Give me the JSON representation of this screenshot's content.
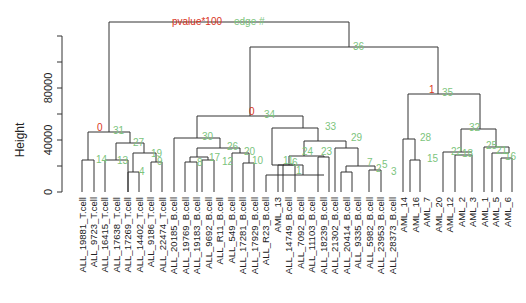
{
  "chart_data": {
    "type": "dendrogram",
    "title": "",
    "xlabel": "",
    "ylabel": "Height",
    "y_ticks": [
      0,
      20000,
      40000,
      60000,
      80000,
      100000,
      120000
    ],
    "y_tick_labels": [
      {
        "value": 0,
        "label": "0"
      },
      {
        "value": 40000,
        "label": "40000"
      },
      {
        "value": 80000,
        "label": "80000"
      }
    ],
    "ylim": [
      0,
      130000
    ],
    "legend_annotations": {
      "au_label": "pvalue*100",
      "bp_label": "edge #",
      "au_color": "#d9341c",
      "bp_color": "#7cc47c"
    },
    "leaves": [
      "ALL_19881_T.cell",
      "ALL_9723_T.cell",
      "ALL_16415_T.cell",
      "ALL_17638_T.cell",
      "ALL_17269_T.cell",
      "ALL_14402_T.cell",
      "ALL_9186_T.cell",
      "ALL_22474_T.cell",
      "ALL_20185_B.cell",
      "ALL_19769_B.cell",
      "ALL_19183_B.cell",
      "ALL_9692_B.cell",
      "ALL_R11_B.cell",
      "ALL_549_B.cell",
      "ALL_17281_B.cell",
      "ALL_17929_B.cell",
      "ALL_R23_B.cell",
      "AML_13",
      "ALL_14749_B.cell",
      "ALL_7092_B.cell",
      "ALL_11103_B.cell",
      "ALL_18239_B.cell",
      "ALL_21302_B.cell",
      "ALL_20414_B.cell",
      "ALL_9335_B.cell",
      "ALL_5982_B.cell",
      "ALL_23953_B.cell",
      "ALL_28373_B.cell",
      "AML_14",
      "AML_16",
      "AML_7",
      "AML_20",
      "AML_12",
      "AML_2",
      "AML_3",
      "AML_1",
      "AML_5",
      "AML_6"
    ],
    "node_annotations": [
      {
        "au": "",
        "edge": "37",
        "height": 131000
      },
      {
        "au": "",
        "edge": "36",
        "height": 112000
      },
      {
        "au": "1",
        "edge": "35",
        "height": 75500
      },
      {
        "au": "0",
        "edge": "34",
        "height": 59000
      },
      {
        "au": "0",
        "edge": "31",
        "height": 45500
      },
      {
        "au": "",
        "edge": "33",
        "height": 49000
      },
      {
        "au": "",
        "edge": "32",
        "height": 47500
      },
      {
        "au": "",
        "edge": "30",
        "height": 42000
      },
      {
        "au": "",
        "edge": "29",
        "height": 40500
      },
      {
        "au": "",
        "edge": "28",
        "height": 40000
      },
      {
        "au": "",
        "edge": "27",
        "height": 36500
      },
      {
        "au": "",
        "edge": "26",
        "height": 34500
      },
      {
        "au": "",
        "edge": "25",
        "height": 32500
      },
      {
        "au": "",
        "edge": "24",
        "height": 31000
      },
      {
        "au": "",
        "edge": "23",
        "height": 30500
      },
      {
        "au": "",
        "edge": "22",
        "height": 30500
      },
      {
        "au": "",
        "edge": "21",
        "height": 30000
      },
      {
        "au": "",
        "edge": "20",
        "height": 29500
      },
      {
        "au": "",
        "edge": "19",
        "height": 29500
      },
      {
        "au": "",
        "edge": "18",
        "height": 28000
      },
      {
        "au": "",
        "edge": "17",
        "height": 26500
      },
      {
        "au": "",
        "edge": "16",
        "height": 26500
      },
      {
        "au": "",
        "edge": "15",
        "height": 24500
      },
      {
        "au": "",
        "edge": "14",
        "height": 26500
      },
      {
        "au": "",
        "edge": "13",
        "height": 26500
      },
      {
        "au": "",
        "edge": "12",
        "height": 24500
      },
      {
        "au": "",
        "edge": "11",
        "height": 22500
      },
      {
        "au": "",
        "edge": "10",
        "height": 22000
      },
      {
        "au": "",
        "edge": "9",
        "height": 23500
      },
      {
        "au": "",
        "edge": "8",
        "height": 23500
      },
      {
        "au": "",
        "edge": "7",
        "height": 18500
      },
      {
        "au": "",
        "edge": "6",
        "height": 18500
      },
      {
        "au": "",
        "edge": "5",
        "height": 16500
      },
      {
        "au": "",
        "edge": "4",
        "height": 15500
      },
      {
        "au": "",
        "edge": "3",
        "height": 15000
      },
      {
        "au": "",
        "edge": "2",
        "height": 14500
      },
      {
        "au": "",
        "edge": "1",
        "height": 14000
      }
    ]
  },
  "render": {
    "plot": {
      "x0": 82,
      "dx": 11.49,
      "y_zero": 192,
      "px_per_unit": 0.0013
    },
    "axis": {
      "x": 62,
      "y_top": 22,
      "y_bottom": 192
    },
    "ticks_px": [
      192,
      166,
      140,
      114,
      88,
      62,
      36
    ],
    "tick_labels": [
      {
        "y": 192,
        "text": "0"
      },
      {
        "y": 140,
        "text": "40000"
      },
      {
        "y": 88,
        "text": "80000"
      }
    ],
    "ylabel": {
      "x": 42,
      "y": 140,
      "text": "Height"
    },
    "header": {
      "au": {
        "x": 172,
        "y": 25,
        "text": "pvalue*100"
      },
      "bp": {
        "x": 234,
        "y": 25,
        "text": "edge #"
      }
    },
    "segments": [
      [
        109,
        22,
        349,
        22
      ],
      [
        109,
        22,
        109,
        132
      ],
      [
        349,
        22,
        349,
        47
      ],
      [
        250,
        47,
        438,
        47
      ],
      [
        250,
        47,
        250,
        116
      ],
      [
        438,
        47,
        438,
        94
      ],
      [
        88,
        132,
        130,
        132
      ],
      [
        88,
        132,
        88,
        160
      ],
      [
        130,
        132,
        130,
        143
      ],
      [
        82,
        160,
        94,
        160
      ],
      [
        82,
        160,
        82,
        192
      ],
      [
        94,
        160,
        94,
        192
      ],
      [
        116,
        143,
        144,
        143
      ],
      [
        116,
        143,
        116,
        160
      ],
      [
        144,
        143,
        144,
        153
      ],
      [
        105,
        160,
        128,
        160
      ],
      [
        105,
        160,
        105,
        192
      ],
      [
        128,
        160,
        128,
        192
      ],
      [
        133,
        153,
        156,
        153
      ],
      [
        133,
        153,
        133,
        172
      ],
      [
        156,
        153,
        156,
        162
      ],
      [
        128,
        172,
        139,
        172
      ],
      [
        128,
        172,
        128,
        192
      ],
      [
        139,
        172,
        139,
        192
      ],
      [
        151,
        162,
        162,
        162
      ],
      [
        151,
        162,
        151,
        192
      ],
      [
        162,
        162,
        162,
        192
      ],
      [
        197,
        116,
        303,
        116
      ],
      [
        197,
        116,
        197,
        138
      ],
      [
        303,
        116,
        303,
        128
      ],
      [
        174,
        138,
        220,
        138
      ],
      [
        174,
        138,
        174,
        192
      ],
      [
        220,
        138,
        220,
        148
      ],
      [
        197,
        148,
        240,
        148
      ],
      [
        197,
        148,
        197,
        157
      ],
      [
        240,
        148,
        240,
        153
      ],
      [
        190,
        157,
        208,
        157
      ],
      [
        190,
        157,
        190,
        162
      ],
      [
        208,
        157,
        208,
        160
      ],
      [
        185,
        162,
        197,
        162
      ],
      [
        185,
        162,
        185,
        192
      ],
      [
        197,
        162,
        197,
        192
      ],
      [
        202,
        160,
        214,
        160
      ],
      [
        202,
        160,
        202,
        192
      ],
      [
        214,
        160,
        214,
        192
      ],
      [
        232,
        153,
        249,
        153
      ],
      [
        232,
        153,
        232,
        192
      ],
      [
        249,
        153,
        249,
        163
      ],
      [
        243,
        163,
        254,
        163
      ],
      [
        243,
        163,
        243,
        192
      ],
      [
        254,
        163,
        254,
        192
      ],
      [
        266,
        175,
        324,
        175
      ],
      [
        266,
        175,
        266,
        192
      ],
      [
        278,
        165,
        303,
        165
      ],
      [
        278,
        165,
        278,
        192
      ],
      [
        303,
        165,
        303,
        175
      ],
      [
        272,
        128,
        318,
        128
      ],
      [
        272,
        128,
        272,
        165
      ],
      [
        318,
        128,
        318,
        141
      ],
      [
        272,
        165,
        284,
        165
      ],
      [
        304,
        141,
        346,
        141
      ],
      [
        304,
        141,
        304,
        156
      ],
      [
        346,
        141,
        346,
        148
      ],
      [
        289,
        156,
        324,
        156
      ],
      [
        289,
        156,
        289,
        165
      ],
      [
        324,
        156,
        324,
        157
      ],
      [
        283,
        165,
        295,
        165
      ],
      [
        283,
        165,
        283,
        192
      ],
      [
        295,
        165,
        295,
        192
      ],
      [
        318,
        157,
        329,
        157
      ],
      [
        318,
        157,
        318,
        192
      ],
      [
        329,
        157,
        329,
        192
      ],
      [
        335,
        148,
        358,
        148
      ],
      [
        335,
        148,
        335,
        192
      ],
      [
        358,
        148,
        358,
        166
      ],
      [
        346,
        166,
        375,
        166
      ],
      [
        346,
        166,
        346,
        172
      ],
      [
        375,
        166,
        375,
        170
      ],
      [
        341,
        172,
        352,
        172
      ],
      [
        341,
        172,
        341,
        192
      ],
      [
        352,
        172,
        352,
        192
      ],
      [
        369,
        170,
        381,
        170
      ],
      [
        369,
        170,
        369,
        192
      ],
      [
        381,
        170,
        381,
        192
      ],
      [
        408,
        94,
        480,
        94
      ],
      [
        408,
        94,
        408,
        139
      ],
      [
        480,
        94,
        480,
        129
      ],
      [
        403,
        139,
        415,
        139
      ],
      [
        403,
        139,
        403,
        192
      ],
      [
        415,
        139,
        415,
        160
      ],
      [
        410,
        160,
        420,
        160
      ],
      [
        410,
        160,
        410,
        192
      ],
      [
        420,
        160,
        420,
        192
      ],
      [
        461,
        129,
        496,
        129
      ],
      [
        461,
        129,
        461,
        152
      ],
      [
        496,
        129,
        496,
        147
      ],
      [
        443,
        152,
        472,
        152
      ],
      [
        443,
        152,
        443,
        192
      ],
      [
        455,
        155,
        472,
        155
      ],
      [
        455,
        155,
        455,
        192
      ],
      [
        472,
        155,
        472,
        192
      ],
      [
        484,
        147,
        509,
        147
      ],
      [
        484,
        147,
        484,
        192
      ],
      [
        509,
        147,
        509,
        153
      ],
      [
        492,
        153,
        509,
        153
      ],
      [
        492,
        153,
        492,
        192
      ],
      [
        501,
        158,
        512,
        158
      ],
      [
        501,
        158,
        501,
        192
      ],
      [
        512,
        158,
        512,
        192
      ]
    ],
    "labels": [
      {
        "x": 97,
        "y": 131,
        "text": "0",
        "kind": "au"
      },
      {
        "x": 113,
        "y": 134,
        "text": "31",
        "kind": "bp"
      },
      {
        "x": 133,
        "y": 146,
        "text": "27",
        "kind": "bp"
      },
      {
        "x": 96,
        "y": 163,
        "text": "14",
        "kind": "bp"
      },
      {
        "x": 117,
        "y": 164,
        "text": "13",
        "kind": "bp"
      },
      {
        "x": 151,
        "y": 157,
        "text": "19",
        "kind": "bp"
      },
      {
        "x": 157,
        "y": 165,
        "text": "9",
        "kind": "bp"
      },
      {
        "x": 139,
        "y": 175,
        "text": "4",
        "kind": "bp"
      },
      {
        "x": 249,
        "y": 115,
        "text": "0",
        "kind": "au"
      },
      {
        "x": 264,
        "y": 118,
        "text": "34",
        "kind": "bp"
      },
      {
        "x": 202,
        "y": 140,
        "text": "30",
        "kind": "bp"
      },
      {
        "x": 227,
        "y": 150,
        "text": "26",
        "kind": "bp"
      },
      {
        "x": 244,
        "y": 155,
        "text": "20",
        "kind": "bp"
      },
      {
        "x": 197,
        "y": 166,
        "text": "8",
        "kind": "bp"
      },
      {
        "x": 209,
        "y": 161,
        "text": "17",
        "kind": "bp"
      },
      {
        "x": 222,
        "y": 165,
        "text": "12",
        "kind": "bp"
      },
      {
        "x": 252,
        "y": 164,
        "text": "10",
        "kind": "bp"
      },
      {
        "x": 283,
        "y": 164,
        "text": "11",
        "kind": "bp"
      },
      {
        "x": 292,
        "y": 166,
        "text": "6",
        "kind": "bp"
      },
      {
        "x": 296,
        "y": 174,
        "text": "1",
        "kind": "bp"
      },
      {
        "x": 325,
        "y": 130,
        "text": "33",
        "kind": "bp"
      },
      {
        "x": 351,
        "y": 141,
        "text": "29",
        "kind": "bp"
      },
      {
        "x": 302,
        "y": 155,
        "text": "24",
        "kind": "bp"
      },
      {
        "x": 321,
        "y": 155,
        "text": "23",
        "kind": "bp"
      },
      {
        "x": 367,
        "y": 166,
        "text": "7",
        "kind": "bp"
      },
      {
        "x": 376,
        "y": 172,
        "text": "2",
        "kind": "bp"
      },
      {
        "x": 382,
        "y": 168,
        "text": "5",
        "kind": "bp"
      },
      {
        "x": 391,
        "y": 175,
        "text": "3",
        "kind": "bp"
      },
      {
        "x": 429,
        "y": 93,
        "text": "1",
        "kind": "au"
      },
      {
        "x": 442,
        "y": 96,
        "text": "35",
        "kind": "bp"
      },
      {
        "x": 353,
        "y": 50,
        "text": "36",
        "kind": "bp"
      },
      {
        "x": 420,
        "y": 141,
        "text": "28",
        "kind": "bp"
      },
      {
        "x": 427,
        "y": 162,
        "text": "15",
        "kind": "bp"
      },
      {
        "x": 469,
        "y": 131,
        "text": "32",
        "kind": "bp"
      },
      {
        "x": 451,
        "y": 155,
        "text": "22",
        "kind": "bp"
      },
      {
        "x": 462,
        "y": 157,
        "text": "18",
        "kind": "bp"
      },
      {
        "x": 486,
        "y": 149,
        "text": "25",
        "kind": "bp"
      },
      {
        "x": 496,
        "y": 154,
        "text": "21",
        "kind": "bp"
      },
      {
        "x": 505,
        "y": 160,
        "text": "16",
        "kind": "bp"
      }
    ]
  }
}
